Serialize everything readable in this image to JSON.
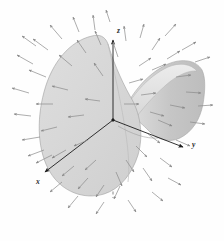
{
  "figure": {
    "background_color": "#fefefe",
    "width": 224,
    "height": 241
  },
  "axes": {
    "label_x": "x",
    "label_y": "y",
    "label_z": "z",
    "axis_color": "#1c1c1c",
    "hidden_axis_style": "dashed",
    "origin": {
      "x": 113,
      "y": 120
    },
    "segments": [
      {
        "name": "z-axis-visible",
        "x1": 113,
        "y1": 120,
        "x2": 113,
        "y2": 36,
        "dashed": false
      },
      {
        "name": "z-axis-hidden",
        "x1": 113,
        "y1": 120,
        "x2": 113,
        "y2": 198,
        "dashed": true
      },
      {
        "name": "x-axis-visible",
        "x1": 113,
        "y1": 120,
        "x2": 42,
        "y2": 174,
        "dashed": false
      },
      {
        "name": "x-axis-hidden",
        "x1": 113,
        "y1": 120,
        "x2": 160,
        "y2": 84,
        "dashed": true
      },
      {
        "name": "y-axis-visible",
        "x1": 113,
        "y1": 120,
        "x2": 186,
        "y2": 148,
        "dashed": false
      },
      {
        "name": "y-axis-hidden",
        "x1": 113,
        "y1": 120,
        "x2": 62,
        "y2": 101,
        "dashed": true
      }
    ],
    "tick_marks": [
      {
        "name": "z-tick",
        "x": 113,
        "y": 40
      },
      {
        "name": "x-tick",
        "x": 47,
        "y": 170
      },
      {
        "name": "y-tick",
        "x": 180,
        "y": 146
      }
    ],
    "label_positions": {
      "x": {
        "x": 36,
        "y": 184
      },
      "y": {
        "x": 194,
        "y": 146
      },
      "z": {
        "x": 116,
        "y": 33
      }
    }
  },
  "surface": {
    "name": "hyperbolic-paraboloid",
    "fill_front": "#d6d6d6",
    "fill_right_lobe": "#c3c3c3",
    "fill_inner": "#e2e2e2",
    "edge_color": "#9a9a9a",
    "opacity": 0.95
  },
  "vector_field": {
    "arrow_color": "#8a8a8a",
    "arrow_color_dark": "#6e6e6e",
    "stroke_width": 0.7,
    "count": 62,
    "description": "Arrows radiate outward from the saddle surface; on the left and upper-left they point up-left, at the top they point up-right, on the right they point right and down-right, and at the bottom they point down-left.",
    "arrows": [
      {
        "x1": 33,
        "y1": 64,
        "x2": 17,
        "y2": 55
      },
      {
        "x1": 29,
        "y1": 93,
        "x2": 12,
        "y2": 88
      },
      {
        "x1": 31,
        "y1": 116,
        "x2": 14,
        "y2": 114
      },
      {
        "x1": 40,
        "y1": 137,
        "x2": 22,
        "y2": 140
      },
      {
        "x1": 52,
        "y1": 155,
        "x2": 36,
        "y2": 163
      },
      {
        "x1": 46,
        "y1": 77,
        "x2": 29,
        "y2": 70
      },
      {
        "x1": 48,
        "y1": 50,
        "x2": 33,
        "y2": 39
      },
      {
        "x1": 62,
        "y1": 39,
        "x2": 50,
        "y2": 25
      },
      {
        "x1": 79,
        "y1": 32,
        "x2": 73,
        "y2": 17
      },
      {
        "x1": 95,
        "y1": 30,
        "x2": 93,
        "y2": 15
      },
      {
        "x1": 53,
        "y1": 104,
        "x2": 36,
        "y2": 104
      },
      {
        "x1": 57,
        "y1": 127,
        "x2": 41,
        "y2": 131
      },
      {
        "x1": 66,
        "y1": 150,
        "x2": 52,
        "y2": 158
      },
      {
        "x1": 74,
        "y1": 166,
        "x2": 62,
        "y2": 176
      },
      {
        "x1": 88,
        "y1": 178,
        "x2": 78,
        "y2": 189
      },
      {
        "x1": 104,
        "y1": 185,
        "x2": 96,
        "y2": 197
      },
      {
        "x1": 120,
        "y1": 186,
        "x2": 114,
        "y2": 199
      },
      {
        "x1": 68,
        "y1": 90,
        "x2": 52,
        "y2": 86
      },
      {
        "x1": 72,
        "y1": 66,
        "x2": 59,
        "y2": 55
      },
      {
        "x1": 86,
        "y1": 53,
        "x2": 77,
        "y2": 40
      },
      {
        "x1": 101,
        "y1": 45,
        "x2": 95,
        "y2": 31
      },
      {
        "x1": 84,
        "y1": 115,
        "x2": 68,
        "y2": 117
      },
      {
        "x1": 88,
        "y1": 140,
        "x2": 74,
        "y2": 146
      },
      {
        "x1": 96,
        "y1": 160,
        "x2": 85,
        "y2": 170
      },
      {
        "x1": 100,
        "y1": 101,
        "x2": 85,
        "y2": 99
      },
      {
        "x1": 103,
        "y1": 76,
        "x2": 94,
        "y2": 63
      },
      {
        "x1": 118,
        "y1": 57,
        "x2": 113,
        "y2": 42
      },
      {
        "x1": 126,
        "y1": 41,
        "x2": 124,
        "y2": 26
      },
      {
        "x1": 140,
        "y1": 38,
        "x2": 144,
        "y2": 24
      },
      {
        "x1": 152,
        "y1": 50,
        "x2": 160,
        "y2": 38
      },
      {
        "x1": 165,
        "y1": 36,
        "x2": 176,
        "y2": 24
      },
      {
        "x1": 182,
        "y1": 50,
        "x2": 196,
        "y2": 42
      },
      {
        "x1": 195,
        "y1": 62,
        "x2": 210,
        "y2": 57
      },
      {
        "x1": 139,
        "y1": 66,
        "x2": 151,
        "y2": 58
      },
      {
        "x1": 129,
        "y1": 83,
        "x2": 143,
        "y2": 79
      },
      {
        "x1": 141,
        "y1": 95,
        "x2": 156,
        "y2": 93
      },
      {
        "x1": 124,
        "y1": 104,
        "x2": 139,
        "y2": 104
      },
      {
        "x1": 152,
        "y1": 70,
        "x2": 166,
        "y2": 64
      },
      {
        "x1": 167,
        "y1": 59,
        "x2": 180,
        "y2": 51
      },
      {
        "x1": 176,
        "y1": 77,
        "x2": 191,
        "y2": 75
      },
      {
        "x1": 186,
        "y1": 92,
        "x2": 201,
        "y2": 93
      },
      {
        "x1": 170,
        "y1": 105,
        "x2": 185,
        "y2": 108
      },
      {
        "x1": 158,
        "y1": 120,
        "x2": 172,
        "y2": 126
      },
      {
        "x1": 148,
        "y1": 134,
        "x2": 160,
        "y2": 143
      },
      {
        "x1": 136,
        "y1": 146,
        "x2": 147,
        "y2": 157
      },
      {
        "x1": 126,
        "y1": 160,
        "x2": 134,
        "y2": 172
      },
      {
        "x1": 143,
        "y1": 168,
        "x2": 152,
        "y2": 181
      },
      {
        "x1": 160,
        "y1": 158,
        "x2": 172,
        "y2": 167
      },
      {
        "x1": 176,
        "y1": 140,
        "x2": 190,
        "y2": 146
      },
      {
        "x1": 190,
        "y1": 122,
        "x2": 205,
        "y2": 124
      },
      {
        "x1": 198,
        "y1": 106,
        "x2": 213,
        "y2": 105
      },
      {
        "x1": 116,
        "y1": 172,
        "x2": 122,
        "y2": 186
      },
      {
        "x1": 104,
        "y1": 202,
        "x2": 96,
        "y2": 214
      },
      {
        "x1": 128,
        "y1": 200,
        "x2": 136,
        "y2": 212
      },
      {
        "x1": 152,
        "y1": 192,
        "x2": 163,
        "y2": 201
      },
      {
        "x1": 168,
        "y1": 178,
        "x2": 181,
        "y2": 185
      },
      {
        "x1": 62,
        "y1": 182,
        "x2": 50,
        "y2": 192
      },
      {
        "x1": 78,
        "y1": 196,
        "x2": 68,
        "y2": 208
      },
      {
        "x1": 44,
        "y1": 150,
        "x2": 28,
        "y2": 156
      },
      {
        "x1": 36,
        "y1": 46,
        "x2": 22,
        "y2": 36
      },
      {
        "x1": 110,
        "y1": 22,
        "x2": 106,
        "y2": 10
      },
      {
        "x1": 150,
        "y1": 112,
        "x2": 164,
        "y2": 116
      }
    ]
  }
}
